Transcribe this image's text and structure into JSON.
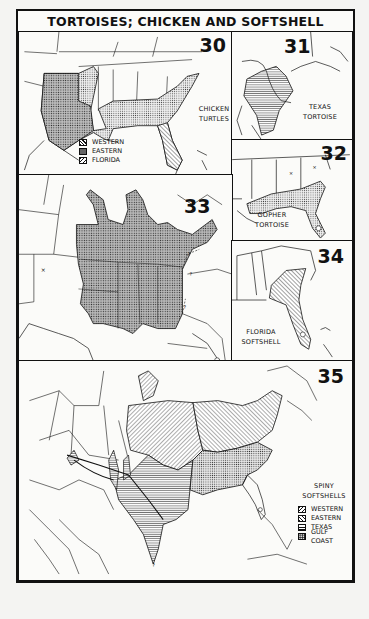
{
  "page": {
    "title": "TORTOISES; CHICKEN AND SOFTSHELL TURTLES"
  },
  "maps": [
    {
      "number": "30",
      "caption_lines": [
        "CHICKEN",
        "TURTLES"
      ],
      "legend": [
        {
          "label": "WESTERN",
          "pattern": "crosshatch-dots"
        },
        {
          "label": "EASTERN",
          "pattern": "fine-dots"
        },
        {
          "label": "FLORIDA",
          "pattern": "diagonal-lines"
        }
      ]
    },
    {
      "number": "31",
      "caption_lines": [
        "TEXAS",
        "TORTOISE"
      ]
    },
    {
      "number": "32",
      "caption_lines": [
        "GOPHER",
        "TORTOISE"
      ]
    },
    {
      "number": "33",
      "caption_lines": [
        "SMOOTH SOFTSHELL"
      ]
    },
    {
      "number": "34",
      "caption_lines": [
        "FLORIDA",
        "SOFTSHELL"
      ]
    },
    {
      "number": "35",
      "caption_lines": [
        "SPINY",
        "SOFTSHELLS"
      ],
      "legend": [
        {
          "label": "WESTERN",
          "pattern": "diagonal-lines-up"
        },
        {
          "label": "EASTERN",
          "pattern": "diagonal-lines-down"
        },
        {
          "label": "TEXAS",
          "pattern": "horizontal-lines"
        },
        {
          "label": "GULF COAST",
          "pattern": "dots"
        }
      ]
    }
  ],
  "map_markers": {
    "uncertain": "?",
    "isolated_record": "×"
  }
}
